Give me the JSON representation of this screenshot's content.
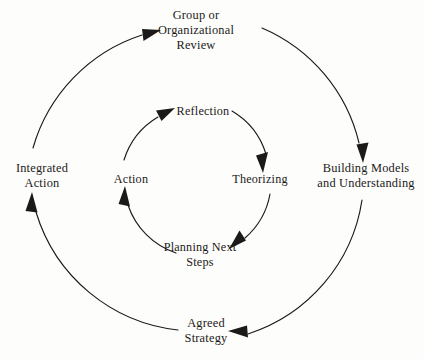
{
  "diagram": {
    "type": "concentric-cycle-diagram",
    "title": "",
    "background_color": "#fdfdfc",
    "stroke_color": "#1c1a18",
    "text_color": "#1c1a18",
    "center": {
      "x": 196,
      "y": 180
    },
    "outer_cycle": {
      "name": "Organizational / group learning cycle",
      "radius": 167,
      "direction": "clockwise",
      "stages": [
        {
          "id": "group-or-organizational-review",
          "label": "Group or\nOrganizational\nReview",
          "position": "top",
          "angle_deg": 270,
          "incoming_arrowheads": [
            "from-left",
            "from-right"
          ]
        },
        {
          "id": "building-models-and-understanding",
          "label": "Building Models\nand Understanding",
          "position": "right",
          "angle_deg": 0,
          "incoming_arrowheads": [
            "from-above"
          ]
        },
        {
          "id": "agreed-strategy",
          "label": "Agreed\nStrategy",
          "position": "bottom",
          "angle_deg": 90,
          "incoming_arrowheads": [
            "from-right"
          ]
        },
        {
          "id": "integrated-action",
          "label": "Integrated\nAction",
          "position": "left",
          "angle_deg": 180,
          "incoming_arrowheads": [
            "from-below"
          ]
        }
      ]
    },
    "inner_cycle": {
      "name": "Individual learning cycle",
      "radius": 76,
      "direction": "clockwise",
      "stages": [
        {
          "id": "reflection",
          "label": "Reflection",
          "position": "top",
          "angle_deg": 270,
          "incoming_arrowheads": [
            "from-left"
          ]
        },
        {
          "id": "theorizing",
          "label": "Theorizing",
          "position": "right",
          "angle_deg": 0,
          "incoming_arrowheads": [
            "from-above"
          ]
        },
        {
          "id": "planning-next-steps",
          "label": "Planning Next\nSteps",
          "position": "bottom",
          "angle_deg": 90,
          "incoming_arrowheads": [
            "from-right"
          ]
        },
        {
          "id": "action",
          "label": "Action",
          "position": "left",
          "angle_deg": 180,
          "incoming_arrowheads": [
            "from-below"
          ]
        }
      ]
    }
  }
}
